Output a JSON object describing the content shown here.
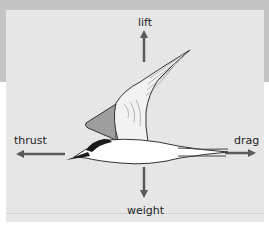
{
  "diagram": {
    "title": "",
    "forces": [
      {
        "id": "lift",
        "label": "lift",
        "direction": "up"
      },
      {
        "id": "weight",
        "label": "weight",
        "direction": "down"
      },
      {
        "id": "thrust",
        "label": "thrust",
        "direction": "left"
      },
      {
        "id": "drag",
        "label": "drag",
        "direction": "right"
      }
    ]
  },
  "colors": {
    "band": "#c4c4c4",
    "panel": "#e6e6e6",
    "arrow": "#5a5a5a",
    "outline": "#333333",
    "cap": "#1a1a1a",
    "wing_shade": "#9e9e9e",
    "body": "#ffffff"
  }
}
